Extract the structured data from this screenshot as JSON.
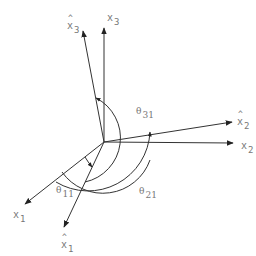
{
  "diagram": {
    "type": "coordinate-axes-rotation",
    "colors": {
      "line": "#333333",
      "label": "#777777",
      "background": "#ffffff"
    },
    "origin": [
      104,
      142
    ],
    "axes": [
      {
        "id": "x1",
        "base": "x",
        "sub": "1",
        "hat": false,
        "tip": [
          24,
          205
        ]
      },
      {
        "id": "x2",
        "base": "x",
        "sub": "2",
        "hat": false,
        "tip": [
          234,
          143
        ]
      },
      {
        "id": "x3",
        "base": "x",
        "sub": "3",
        "hat": false,
        "tip": [
          104,
          27
        ]
      },
      {
        "id": "x1_hat",
        "base": "x",
        "sub": "1",
        "hat": true,
        "tip": [
          63,
          228
        ]
      },
      {
        "id": "x2_hat",
        "base": "x",
        "sub": "2",
        "hat": true,
        "tip": [
          233,
          122
        ]
      },
      {
        "id": "x3_hat",
        "base": "x",
        "sub": "3",
        "hat": true,
        "tip": [
          83,
          30
        ]
      }
    ],
    "labels": {
      "x1": {
        "base": "x",
        "sub": "1",
        "hat": ""
      },
      "x2": {
        "base": "x",
        "sub": "2",
        "hat": ""
      },
      "x3": {
        "base": "x",
        "sub": "3",
        "hat": ""
      },
      "x1_hat": {
        "base": "x",
        "sub": "1",
        "hat": "^"
      },
      "x2_hat": {
        "base": "x",
        "sub": "2",
        "hat": "^"
      },
      "x3_hat": {
        "base": "x",
        "sub": "3",
        "hat": "^"
      }
    },
    "angles": {
      "theta11": {
        "symbol": "θ",
        "sub": "11",
        "from": "x1",
        "to": "x1_hat"
      },
      "theta21": {
        "symbol": "θ",
        "sub": "21",
        "from": "x1_hat",
        "to": "x2"
      },
      "theta31": {
        "symbol": "θ",
        "sub": "31",
        "from": "x1_hat",
        "to": "x3"
      }
    }
  }
}
